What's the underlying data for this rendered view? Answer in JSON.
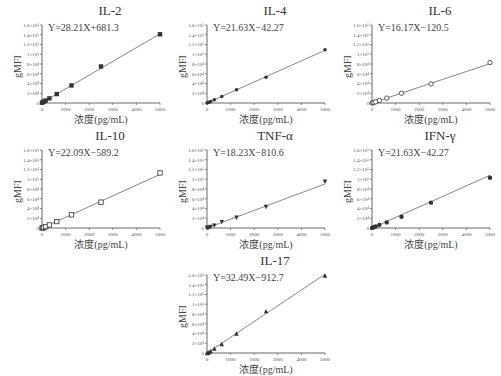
{
  "figure": {
    "x_axis_label": "浓度(pg/mL)",
    "y_axis_label": "gMFI",
    "y_ticks": [
      "0",
      "2×10⁴",
      "4×10⁴",
      "6×10⁴",
      "8×10⁴",
      "1×10⁵",
      "1.2×10⁵",
      "1.4×10⁵",
      "1.6×10⁵"
    ],
    "x_ticks": [
      "0",
      "1000",
      "2000",
      "3000",
      "4000",
      "5000"
    ]
  },
  "panels": [
    {
      "title": "IL-2",
      "equation": "Y=28.21X+681.3",
      "marker": "filled-square"
    },
    {
      "title": "IL-4",
      "equation": "Y=21.63X−42.27",
      "marker": "filled-diamond"
    },
    {
      "title": "IL-6",
      "equation": "Y=16.17X−120.5",
      "marker": "open-circle"
    },
    {
      "title": "IL-10",
      "equation": "Y=22.09X−589.2",
      "marker": "open-square"
    },
    {
      "title": "TNF-α",
      "equation": "Y=18.23X−810.6",
      "marker": "filled-triangle-down"
    },
    {
      "title": "IFN-γ",
      "equation": "Y=21.63X−42.27",
      "marker": "filled-circle"
    },
    {
      "title": "IL-17",
      "equation": "Y=32.49X−912.7",
      "marker": "filled-triangle-up"
    }
  ],
  "chart_data": [
    {
      "type": "scatter",
      "title": "IL-2",
      "annotation": "Y=28.21X+681.3",
      "xlabel": "浓度(pg/mL)",
      "ylabel": "gMFI",
      "xlim": [
        0,
        5000
      ],
      "ylim": [
        0,
        160000
      ],
      "x": [
        0,
        39,
        78,
        156,
        312.5,
        625,
        1250,
        2500,
        5000
      ],
      "y": [
        700,
        1800,
        2900,
        5100,
        9500,
        18300,
        36000,
        75000,
        141000
      ],
      "fit": {
        "slope": 28.21,
        "intercept": 681.3
      }
    },
    {
      "type": "scatter",
      "title": "IL-4",
      "annotation": "Y=21.63X−42.27",
      "xlabel": "浓度(pg/mL)",
      "ylabel": "gMFI",
      "xlim": [
        0,
        5000
      ],
      "ylim": [
        0,
        160000
      ],
      "x": [
        0,
        39,
        78,
        156,
        312.5,
        625,
        1250,
        2500,
        5000
      ],
      "y": [
        0,
        800,
        1700,
        3300,
        6700,
        13500,
        27000,
        53000,
        109000
      ],
      "fit": {
        "slope": 21.63,
        "intercept": -42.27
      }
    },
    {
      "type": "scatter",
      "title": "IL-6",
      "annotation": "Y=16.17X−120.5",
      "xlabel": "浓度(pg/mL)",
      "ylabel": "gMFI",
      "xlim": [
        0,
        5000
      ],
      "ylim": [
        0,
        160000
      ],
      "x": [
        0,
        39,
        78,
        156,
        312.5,
        625,
        1250,
        2500,
        5000
      ],
      "y": [
        0,
        500,
        1100,
        2400,
        5000,
        10000,
        20000,
        39000,
        83000
      ],
      "fit": {
        "slope": 16.17,
        "intercept": -120.5
      }
    },
    {
      "type": "scatter",
      "title": "IL-10",
      "annotation": "Y=22.09X−589.2",
      "xlabel": "浓度(pg/mL)",
      "ylabel": "gMFI",
      "xlim": [
        0,
        5000
      ],
      "ylim": [
        0,
        160000
      ],
      "x": [
        0,
        39,
        78,
        156,
        312.5,
        625,
        1250,
        2500,
        5000
      ],
      "y": [
        0,
        300,
        1100,
        2900,
        6300,
        13200,
        27000,
        53000,
        113000
      ],
      "fit": {
        "slope": 22.09,
        "intercept": -589.2
      }
    },
    {
      "type": "scatter",
      "title": "TNF-α",
      "annotation": "Y=18.23X−810.6",
      "xlabel": "浓度(pg/mL)",
      "ylabel": "gMFI",
      "xlim": [
        0,
        5000
      ],
      "ylim": [
        0,
        160000
      ],
      "x": [
        0,
        39,
        78,
        156,
        312.5,
        625,
        1250,
        2500,
        5000
      ],
      "y": [
        0,
        0,
        600,
        2000,
        4900,
        12000,
        21000,
        43000,
        95000
      ],
      "fit": {
        "slope": 18.23,
        "intercept": -810.6
      }
    },
    {
      "type": "scatter",
      "title": "IFN-γ",
      "annotation": "Y=21.63X−42.27",
      "xlabel": "浓度(pg/mL)",
      "ylabel": "gMFI",
      "xlim": [
        0,
        5000
      ],
      "ylim": [
        0,
        160000
      ],
      "x": [
        0,
        39,
        78,
        156,
        312.5,
        625,
        1250,
        2500,
        5000
      ],
      "y": [
        0,
        800,
        1700,
        3300,
        6500,
        11500,
        23000,
        52000,
        103000
      ],
      "fit": {
        "slope": 21.63,
        "intercept": -42.27
      }
    },
    {
      "type": "scatter",
      "title": "IL-17",
      "annotation": "Y=32.49X−912.7",
      "xlabel": "浓度(pg/mL)",
      "ylabel": "gMFI",
      "xlim": [
        0,
        5000
      ],
      "ylim": [
        0,
        160000
      ],
      "x": [
        0,
        39,
        78,
        156,
        312.5,
        625,
        1250,
        2500,
        5000
      ],
      "y": [
        0,
        400,
        1600,
        4200,
        9200,
        18500,
        40000,
        86000,
        159000
      ],
      "fit": {
        "slope": 32.49,
        "intercept": -912.7
      }
    }
  ]
}
